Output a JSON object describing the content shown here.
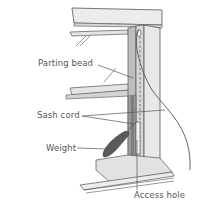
{
  "diagram": {
    "labels": [
      {
        "id": "parting-bead",
        "text": "Parting bead"
      },
      {
        "id": "sash-cord",
        "text": "Sash cord"
      },
      {
        "id": "weight",
        "text": "Weight"
      },
      {
        "id": "access-hole",
        "text": "Access hole"
      }
    ],
    "colors": {
      "frame_light": "#ececec",
      "frame_mid": "#d6d6d6",
      "frame_dark": "#9a9a9a",
      "weight": "#5a5a5a",
      "line": "#555555",
      "background": "#ffffff"
    }
  }
}
